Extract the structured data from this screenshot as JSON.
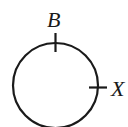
{
  "diagram": {
    "type": "circle-with-marked-points",
    "stroke_color": "#1a1a1a",
    "background": "#ffffff",
    "circle": {
      "cx": 55.5,
      "cy": 85.5,
      "r": 42.5
    },
    "points": [
      {
        "label": "B",
        "position": "top",
        "tick": "vertical"
      },
      {
        "label": "X",
        "position": "right",
        "tick": "horizontal"
      }
    ]
  }
}
